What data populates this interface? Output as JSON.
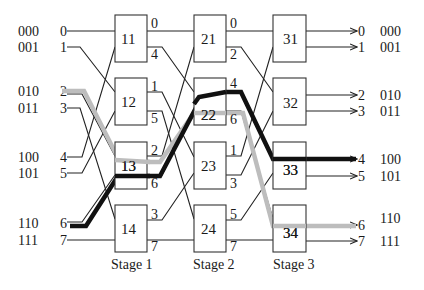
{
  "diagram": {
    "type": "Omega / butterfly multistage interconnection network (8x8, 2x2 switches)",
    "stages": [
      {
        "label": "Stage 1",
        "switches": [
          "11",
          "12",
          "13",
          "14"
        ]
      },
      {
        "label": "Stage 2",
        "switches": [
          "21",
          "22",
          "23",
          "24"
        ]
      },
      {
        "label": "Stage 3",
        "switches": [
          "31",
          "32",
          "33",
          "34"
        ]
      }
    ],
    "inputs": [
      {
        "binary": "000",
        "port": "0"
      },
      {
        "binary": "001",
        "port": "1"
      },
      {
        "binary": "010",
        "port": "2"
      },
      {
        "binary": "011",
        "port": "3"
      },
      {
        "binary": "100",
        "port": "4"
      },
      {
        "binary": "101",
        "port": "5"
      },
      {
        "binary": "110",
        "port": "6"
      },
      {
        "binary": "111",
        "port": "7"
      }
    ],
    "outputs": [
      {
        "port": "0",
        "binary": "000"
      },
      {
        "port": "1",
        "binary": "001"
      },
      {
        "port": "2",
        "binary": "010"
      },
      {
        "port": "3",
        "binary": "011"
      },
      {
        "port": "4",
        "binary": "100"
      },
      {
        "port": "5",
        "binary": "101"
      },
      {
        "port": "6",
        "binary": "110"
      },
      {
        "port": "7",
        "binary": "111"
      }
    ],
    "stage1_out_labels": [
      "0",
      "4",
      "1",
      "5",
      "2",
      "6",
      "3",
      "7"
    ],
    "stage2_out_labels": [
      "0",
      "2",
      "4",
      "6",
      "1",
      "3",
      "5",
      "7"
    ],
    "paths": [
      {
        "name": "black-path",
        "color": "#111111",
        "from": "6",
        "to": "4",
        "via": [
          "13",
          "22",
          "33"
        ]
      },
      {
        "name": "gray-path",
        "color": "#b8b8b8",
        "from": "2",
        "to": "6",
        "via": [
          "13",
          "22",
          "34"
        ]
      }
    ]
  }
}
